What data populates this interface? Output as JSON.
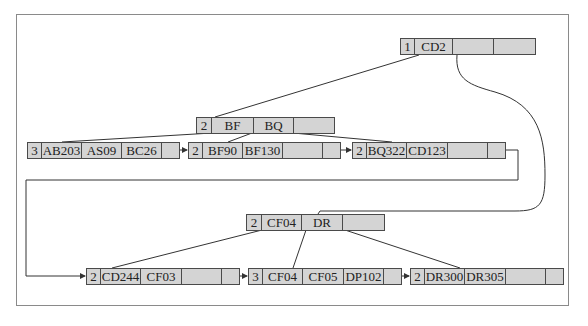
{
  "diagram": {
    "type": "B+ tree",
    "nodes": {
      "root": {
        "count": "1",
        "keys": [
          "CD2",
          "",
          ""
        ]
      },
      "internal_left": {
        "count": "2",
        "keys": [
          "BF",
          "BQ",
          ""
        ]
      },
      "internal_right": {
        "count": "2",
        "keys": [
          "CF04",
          "DR",
          ""
        ]
      },
      "leaf1": {
        "count": "3",
        "keys": [
          "AB203",
          "AS09",
          "BC26"
        ]
      },
      "leaf2": {
        "count": "2",
        "keys": [
          "BF90",
          "BF130",
          ""
        ]
      },
      "leaf3": {
        "count": "2",
        "keys": [
          "BQ322",
          "CD123",
          ""
        ]
      },
      "leaf4": {
        "count": "2",
        "keys": [
          "CD244",
          "CF03",
          ""
        ]
      },
      "leaf5": {
        "count": "3",
        "keys": [
          "CF04",
          "CF05",
          "DP102"
        ]
      },
      "leaf6": {
        "count": "2",
        "keys": [
          "DR300",
          "DR305",
          ""
        ]
      }
    },
    "colors": {
      "node_fill": "#d4d4d4",
      "line": "#333333",
      "frame": "#8a8a8a"
    }
  }
}
